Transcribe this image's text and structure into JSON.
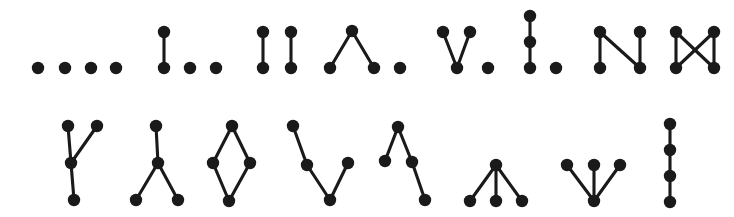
{
  "figure": {
    "title": "",
    "caption": "",
    "background_color": "#ffffff",
    "vertex_color": "#1a1a1a",
    "edge_color": "#1a1a1a",
    "vertex_radius": 6.2,
    "edge_width": 3.1,
    "rows": 2,
    "columns": 8,
    "total_graphs": 16,
    "vertices_per_graph": 4
  },
  "chart_data": {
    "type": "diagram",
    "xlabel": "",
    "ylabel": "",
    "layout": {
      "rows": 2,
      "cols": 8,
      "grid_order": "row-major"
    },
    "graphs": [
      {
        "index": 1,
        "row": 1,
        "col": 1,
        "name": "empty-graph",
        "label": "four isolated vertices",
        "vertex_count": 4,
        "edge_count": 0,
        "nodes": [
          {
            "id": "a",
            "x": 38,
            "y": 68
          },
          {
            "id": "b",
            "x": 65,
            "y": 68
          },
          {
            "id": "c",
            "x": 91,
            "y": 68
          },
          {
            "id": "d",
            "x": 116,
            "y": 68
          }
        ],
        "edges": []
      },
      {
        "index": 2,
        "row": 1,
        "col": 2,
        "name": "single-edge-plus-two-isolated",
        "label": "one edge and two isolated vertices",
        "vertex_count": 4,
        "edge_count": 1,
        "nodes": [
          {
            "id": "a",
            "x": 164,
            "y": 32
          },
          {
            "id": "b",
            "x": 164,
            "y": 68
          },
          {
            "id": "c",
            "x": 190,
            "y": 68
          },
          {
            "id": "d",
            "x": 216,
            "y": 68
          }
        ],
        "edges": [
          [
            "a",
            "b"
          ]
        ]
      },
      {
        "index": 3,
        "row": 1,
        "col": 3,
        "name": "perfect-matching",
        "label": "two disjoint edges",
        "vertex_count": 4,
        "edge_count": 2,
        "nodes": [
          {
            "id": "a",
            "x": 263,
            "y": 32
          },
          {
            "id": "b",
            "x": 263,
            "y": 68
          },
          {
            "id": "c",
            "x": 291,
            "y": 32
          },
          {
            "id": "d",
            "x": 291,
            "y": 68
          }
        ],
        "edges": [
          [
            "a",
            "b"
          ],
          [
            "c",
            "d"
          ]
        ]
      },
      {
        "index": 4,
        "row": 1,
        "col": 4,
        "name": "path-three-plus-isolated-peak",
        "label": "path on three vertices (peak) and one isolated vertex",
        "vertex_count": 4,
        "edge_count": 2,
        "nodes": [
          {
            "id": "a",
            "x": 352,
            "y": 31
          },
          {
            "id": "b",
            "x": 330,
            "y": 68
          },
          {
            "id": "c",
            "x": 374,
            "y": 68
          },
          {
            "id": "d",
            "x": 400,
            "y": 68
          }
        ],
        "edges": [
          [
            "a",
            "b"
          ],
          [
            "a",
            "c"
          ]
        ]
      },
      {
        "index": 5,
        "row": 1,
        "col": 5,
        "name": "path-three-plus-isolated-valley",
        "label": "path on three vertices (valley) and one isolated vertex",
        "vertex_count": 4,
        "edge_count": 2,
        "nodes": [
          {
            "id": "a",
            "x": 443,
            "y": 32
          },
          {
            "id": "b",
            "x": 470,
            "y": 32
          },
          {
            "id": "c",
            "x": 457,
            "y": 68
          },
          {
            "id": "d",
            "x": 488,
            "y": 68
          }
        ],
        "edges": [
          [
            "a",
            "c"
          ],
          [
            "b",
            "c"
          ]
        ]
      },
      {
        "index": 6,
        "row": 1,
        "col": 6,
        "name": "vertical-path-three-plus-isolated",
        "label": "vertical path on three vertices and one isolated vertex",
        "vertex_count": 4,
        "edge_count": 2,
        "nodes": [
          {
            "id": "a",
            "x": 530,
            "y": 16
          },
          {
            "id": "b",
            "x": 530,
            "y": 42
          },
          {
            "id": "c",
            "x": 530,
            "y": 68
          },
          {
            "id": "d",
            "x": 556,
            "y": 68
          }
        ],
        "edges": [
          [
            "a",
            "b"
          ],
          [
            "b",
            "c"
          ]
        ]
      },
      {
        "index": 7,
        "row": 1,
        "col": 7,
        "name": "path-four-n-shape",
        "label": "path on four vertices drawn as an N",
        "vertex_count": 4,
        "edge_count": 3,
        "nodes": [
          {
            "id": "a",
            "x": 600,
            "y": 32
          },
          {
            "id": "b",
            "x": 600,
            "y": 68
          },
          {
            "id": "c",
            "x": 640,
            "y": 68
          },
          {
            "id": "d",
            "x": 640,
            "y": 32
          }
        ],
        "edges": [
          [
            "a",
            "b"
          ],
          [
            "a",
            "c"
          ],
          [
            "c",
            "d"
          ]
        ]
      },
      {
        "index": 8,
        "row": 1,
        "col": 8,
        "name": "cycle-four-bowtie",
        "label": "four-cycle drawn with crossing diagonals",
        "vertex_count": 4,
        "edge_count": 4,
        "nodes": [
          {
            "id": "a",
            "x": 676,
            "y": 32
          },
          {
            "id": "b",
            "x": 676,
            "y": 68
          },
          {
            "id": "c",
            "x": 714,
            "y": 68
          },
          {
            "id": "d",
            "x": 714,
            "y": 32
          }
        ],
        "edges": [
          [
            "a",
            "b"
          ],
          [
            "d",
            "c"
          ],
          [
            "a",
            "c"
          ],
          [
            "d",
            "b"
          ]
        ]
      },
      {
        "index": 9,
        "row": 2,
        "col": 1,
        "name": "star-y-upright",
        "label": "star on four vertices drawn as a Y",
        "vertex_count": 4,
        "edge_count": 3,
        "nodes": [
          {
            "id": "center",
            "x": 71,
            "y": 163
          },
          {
            "id": "a",
            "x": 68,
            "y": 126
          },
          {
            "id": "b",
            "x": 97,
            "y": 126
          },
          {
            "id": "c",
            "x": 74,
            "y": 200
          }
        ],
        "edges": [
          [
            "center",
            "a"
          ],
          [
            "center",
            "b"
          ],
          [
            "center",
            "c"
          ]
        ]
      },
      {
        "index": 10,
        "row": 2,
        "col": 2,
        "name": "star-y-inverted",
        "label": "star on four vertices drawn as an inverted Y",
        "vertex_count": 4,
        "edge_count": 3,
        "nodes": [
          {
            "id": "center",
            "x": 158,
            "y": 163
          },
          {
            "id": "a",
            "x": 156,
            "y": 126
          },
          {
            "id": "b",
            "x": 136,
            "y": 200
          },
          {
            "id": "c",
            "x": 178,
            "y": 200
          }
        ],
        "edges": [
          [
            "center",
            "a"
          ],
          [
            "center",
            "b"
          ],
          [
            "center",
            "c"
          ]
        ]
      },
      {
        "index": 11,
        "row": 2,
        "col": 3,
        "name": "cycle-four-diamond",
        "label": "four-cycle drawn as a diamond",
        "vertex_count": 4,
        "edge_count": 4,
        "nodes": [
          {
            "id": "top",
            "x": 232,
            "y": 126
          },
          {
            "id": "left",
            "x": 213,
            "y": 163
          },
          {
            "id": "right",
            "x": 250,
            "y": 163
          },
          {
            "id": "bottom",
            "x": 229,
            "y": 201
          }
        ],
        "edges": [
          [
            "top",
            "left"
          ],
          [
            "top",
            "right"
          ],
          [
            "left",
            "bottom"
          ],
          [
            "right",
            "bottom"
          ]
        ]
      },
      {
        "index": 12,
        "row": 2,
        "col": 4,
        "name": "path-four-zigzag-left",
        "label": "path on four vertices with a descending left arm",
        "vertex_count": 4,
        "edge_count": 3,
        "nodes": [
          {
            "id": "a",
            "x": 293,
            "y": 126
          },
          {
            "id": "b",
            "x": 307,
            "y": 165
          },
          {
            "id": "c",
            "x": 330,
            "y": 200
          },
          {
            "id": "d",
            "x": 348,
            "y": 163
          }
        ],
        "edges": [
          [
            "a",
            "b"
          ],
          [
            "b",
            "c"
          ],
          [
            "c",
            "d"
          ]
        ]
      },
      {
        "index": 13,
        "row": 2,
        "col": 5,
        "name": "path-four-zigzag-right",
        "label": "path on four vertices with a descending right arm",
        "vertex_count": 4,
        "edge_count": 3,
        "nodes": [
          {
            "id": "a",
            "x": 385,
            "y": 161
          },
          {
            "id": "b",
            "x": 398,
            "y": 127
          },
          {
            "id": "c",
            "x": 412,
            "y": 162
          },
          {
            "id": "d",
            "x": 425,
            "y": 200
          }
        ],
        "edges": [
          [
            "a",
            "b"
          ],
          [
            "b",
            "c"
          ],
          [
            "c",
            "d"
          ]
        ]
      },
      {
        "index": 14,
        "row": 2,
        "col": 6,
        "name": "star-three-legs-down",
        "label": "star on four vertices with apex on top and three legs below",
        "vertex_count": 4,
        "edge_count": 3,
        "nodes": [
          {
            "id": "center",
            "x": 496,
            "y": 165
          },
          {
            "id": "a",
            "x": 470,
            "y": 201
          },
          {
            "id": "b",
            "x": 496,
            "y": 201
          },
          {
            "id": "c",
            "x": 522,
            "y": 201
          }
        ],
        "edges": [
          [
            "center",
            "a"
          ],
          [
            "center",
            "b"
          ],
          [
            "center",
            "c"
          ]
        ]
      },
      {
        "index": 15,
        "row": 2,
        "col": 7,
        "name": "star-three-legs-up",
        "label": "star on four vertices with centre at the bottom and three legs above",
        "vertex_count": 4,
        "edge_count": 3,
        "nodes": [
          {
            "id": "center",
            "x": 594,
            "y": 201
          },
          {
            "id": "a",
            "x": 567,
            "y": 165
          },
          {
            "id": "b",
            "x": 594,
            "y": 165
          },
          {
            "id": "c",
            "x": 620,
            "y": 165
          }
        ],
        "edges": [
          [
            "center",
            "a"
          ],
          [
            "center",
            "b"
          ],
          [
            "center",
            "c"
          ]
        ]
      },
      {
        "index": 16,
        "row": 2,
        "col": 8,
        "name": "vertical-path-four",
        "label": "vertical path on four vertices",
        "vertex_count": 4,
        "edge_count": 3,
        "nodes": [
          {
            "id": "a",
            "x": 670,
            "y": 124
          },
          {
            "id": "b",
            "x": 670,
            "y": 150
          },
          {
            "id": "c",
            "x": 670,
            "y": 176
          },
          {
            "id": "d",
            "x": 670,
            "y": 202
          }
        ],
        "edges": [
          [
            "a",
            "b"
          ],
          [
            "b",
            "c"
          ],
          [
            "c",
            "d"
          ]
        ]
      }
    ]
  }
}
